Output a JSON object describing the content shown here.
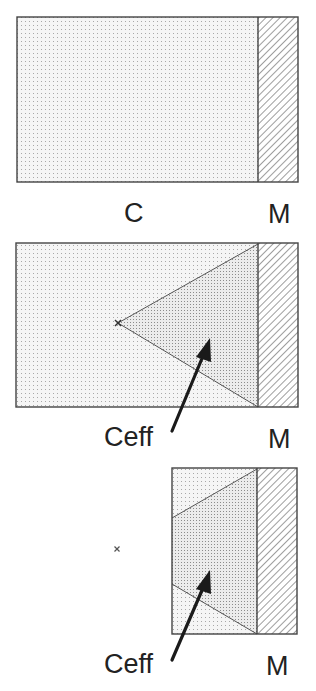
{
  "figure": {
    "type": "schematic-diagram",
    "colors": {
      "background": "#ffffff",
      "outline": "#444444",
      "dot_fill": "#f4f4f4",
      "dot_color": "#9a9a9a",
      "dense_dot_fill": "#e9e9e9",
      "hatch_color": "#666666",
      "arrow": "#1a1a1a",
      "text": "#222222"
    }
  },
  "panels": [
    {
      "id": "panel-1",
      "labels": {
        "region": "C",
        "metal": "M"
      }
    },
    {
      "id": "panel-2",
      "labels": {
        "region": "Ceff",
        "metal": "M"
      },
      "point_marker": "x"
    },
    {
      "id": "panel-3",
      "labels": {
        "region": "Ceff",
        "metal": "M"
      },
      "point_marker": "x"
    }
  ]
}
